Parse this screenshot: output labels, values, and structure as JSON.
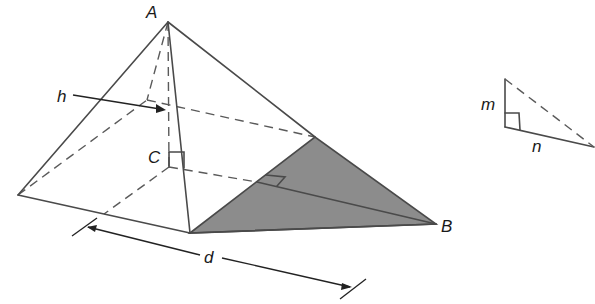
{
  "figure": {
    "labels": {
      "apex": "A",
      "base_center": "C",
      "vertex_b": "B",
      "height": "h",
      "base_dimension": "d",
      "leg_m": "m",
      "leg_n": "n"
    },
    "colors": {
      "line": "#4a4a4a",
      "dashed": "#5a5a5a",
      "shade": "#8c8c8c",
      "label": "#1a1a1a"
    }
  }
}
